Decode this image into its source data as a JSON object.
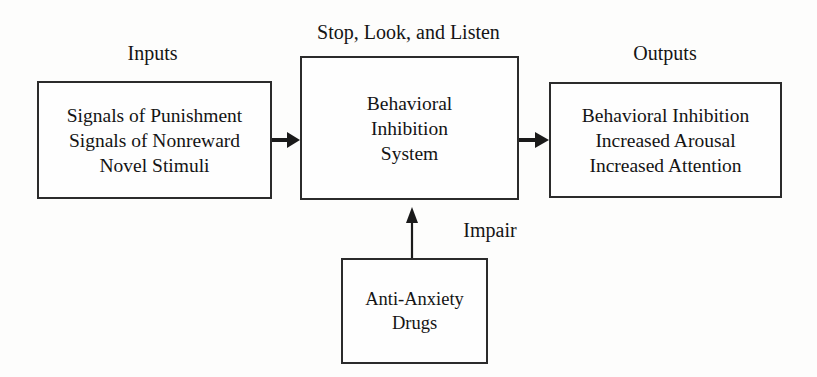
{
  "diagram": {
    "title": "Behavioral Inhibition System",
    "captions": {
      "inputs": "Inputs",
      "center": "Stop, Look, and Listen",
      "outputs": "Outputs"
    },
    "boxes": {
      "inputs": {
        "lines": [
          "Signals of Punishment",
          "Signals of Nonreward",
          "Novel Stimuli"
        ]
      },
      "bis": {
        "lines": [
          "Behavioral",
          "Inhibition",
          "System"
        ]
      },
      "outputs": {
        "lines": [
          "Behavioral Inhibition",
          "Increased Arousal",
          "Increased Attention"
        ]
      },
      "drugs": {
        "lines": [
          "Anti-Anxiety",
          "Drugs"
        ]
      }
    },
    "edge_labels": {
      "impair": "Impair"
    },
    "colors": {
      "background": "#fdfdfc",
      "box_border": "#2b2b2b",
      "box_fill": "#fefefe",
      "text": "#141414",
      "arrow": "#1a1a1a"
    }
  }
}
